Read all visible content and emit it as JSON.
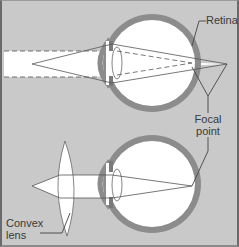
{
  "diagram": {
    "title": "",
    "colors": {
      "background": "#c9c9c9",
      "sclera": "#8c8c8c",
      "eye_interior": "#ffffff",
      "light_beam": "#ffffff",
      "line": "#555555",
      "text": "#3a3a3a"
    },
    "labels": {
      "retina": "Retina",
      "focal_line1": "Focal",
      "focal_line2": "point",
      "convex_line1": "Convex",
      "convex_line2": "lens"
    },
    "panels": [
      {
        "name": "uncorrected-eye",
        "description": "Rays converge behind the retina"
      },
      {
        "name": "corrected-eye",
        "description": "Convex lens focuses rays on the retina"
      }
    ]
  }
}
